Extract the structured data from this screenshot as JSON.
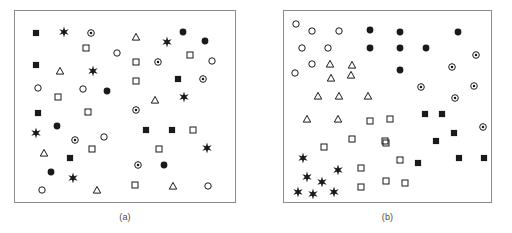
{
  "figure": {
    "width": 512,
    "height": 233,
    "background": "#ffffff",
    "frame_color": "#8c8c8c",
    "ink_color": "#1a1a1a"
  },
  "legend_symbols": {
    "filled-square": "filled square",
    "open-square": "open square",
    "filled-circle": "filled circle",
    "open-circle": "open circle",
    "circled-dot": "circle with center dot",
    "triangle": "open triangle",
    "star": "six-pointed star / asterisk"
  },
  "chart_data": {
    "type": "scatter",
    "title": "",
    "xlabel": "",
    "ylabel": "",
    "grid": false,
    "legend_position": "none",
    "panels": [
      {
        "id": "a",
        "caption": "(a)",
        "frame": {
          "x": 14,
          "y": 10,
          "width": 222,
          "height": 193
        },
        "xlim": [
          0,
          100
        ],
        "ylim": [
          0,
          100
        ],
        "description": "randomly intermixed symbol classes",
        "series": [
          {
            "name": "filled-square",
            "points": [
              [
                36,
                33
              ],
              [
                36,
                65
              ],
              [
                178,
                79
              ],
              [
                38,
                113
              ],
              [
                70,
                158
              ],
              [
                146,
                130
              ],
              [
                172,
                130
              ]
            ]
          },
          {
            "name": "open-square",
            "points": [
              [
                86,
                48
              ],
              [
                58,
                97
              ],
              [
                136,
                62
              ],
              [
                190,
                55
              ],
              [
                136,
                81
              ],
              [
                88,
                112
              ],
              [
                92,
                149
              ],
              [
                193,
                130
              ],
              [
                159,
                149
              ],
              [
                135,
                185
              ]
            ]
          },
          {
            "name": "filled-circle",
            "points": [
              [
                107,
                91
              ],
              [
                183,
                32
              ],
              [
                205,
                41
              ],
              [
                57,
                126
              ],
              [
                51,
                172
              ],
              [
                164,
                165
              ]
            ]
          },
          {
            "name": "open-circle",
            "points": [
              [
                117,
                53
              ],
              [
                38,
                88
              ],
              [
                83,
                89
              ],
              [
                212,
                61
              ],
              [
                104,
                137
              ],
              [
                42,
                190
              ],
              [
                208,
                186
              ]
            ]
          },
          {
            "name": "circled-dot",
            "points": [
              [
                91,
                33
              ],
              [
                158,
                62
              ],
              [
                203,
                79
              ],
              [
                75,
                140
              ],
              [
                136,
                110
              ],
              [
                138,
                165
              ]
            ]
          },
          {
            "name": "triangle",
            "points": [
              [
                60,
                71
              ],
              [
                136,
                37
              ],
              [
                155,
                100
              ],
              [
                44,
                153
              ],
              [
                97,
                190
              ],
              [
                173,
                186
              ]
            ]
          },
          {
            "name": "star",
            "points": [
              [
                64,
                32
              ],
              [
                93,
                71
              ],
              [
                167,
                42
              ],
              [
                184,
                97
              ],
              [
                36,
                133
              ],
              [
                73,
                178
              ],
              [
                207,
                148
              ]
            ]
          }
        ]
      },
      {
        "id": "b",
        "caption": "(b)",
        "frame": {
          "x": 283,
          "y": 10,
          "width": 209,
          "height": 193
        },
        "xlim": [
          0,
          100
        ],
        "ylim": [
          0,
          100
        ],
        "description": "symbol classes sorted into spatially coherent clusters",
        "series": [
          {
            "name": "open-circle",
            "points": [
              [
                296,
                24
              ],
              [
                312,
                31
              ],
              [
                339,
                31
              ],
              [
                302,
                48
              ],
              [
                328,
                48
              ],
              [
                312,
                64
              ],
              [
                295,
                73
              ]
            ]
          },
          {
            "name": "filled-circle",
            "points": [
              [
                370,
                30
              ],
              [
                400,
                32
              ],
              [
                458,
                32
              ],
              [
                370,
                48
              ],
              [
                400,
                48
              ],
              [
                426,
                48
              ],
              [
                400,
                70
              ]
            ]
          },
          {
            "name": "circled-dot",
            "points": [
              [
                476,
                55
              ],
              [
                452,
                67
              ],
              [
                421,
                87
              ],
              [
                474,
                86
              ],
              [
                455,
                98
              ],
              [
                483,
                127
              ]
            ]
          },
          {
            "name": "triangle",
            "points": [
              [
                352,
                65
              ],
              [
                330,
                64
              ],
              [
                351,
                75
              ],
              [
                331,
                78
              ],
              [
                318,
                96
              ],
              [
                339,
                96
              ],
              [
                368,
                96
              ],
              [
                307,
                119
              ],
              [
                338,
                119
              ]
            ]
          },
          {
            "name": "open-square",
            "points": [
              [
                370,
                121
              ],
              [
                390,
                119
              ],
              [
                352,
                139
              ],
              [
                385,
                141
              ],
              [
                324,
                147
              ],
              [
                386,
                143
              ],
              [
                361,
                168
              ],
              [
                400,
                160
              ],
              [
                361,
                187
              ],
              [
                386,
                181
              ],
              [
                405,
                183
              ]
            ]
          },
          {
            "name": "filled-square",
            "points": [
              [
                425,
                114
              ],
              [
                442,
                114
              ],
              [
                454,
                133
              ],
              [
                436,
                141
              ],
              [
                418,
                163
              ],
              [
                459,
                158
              ],
              [
                484,
                158
              ]
            ]
          },
          {
            "name": "star",
            "points": [
              [
                303,
                158
              ],
              [
                338,
                170
              ],
              [
                307,
                177
              ],
              [
                322,
                182
              ],
              [
                298,
                192
              ],
              [
                313,
                194
              ],
              [
                334,
                192
              ]
            ]
          }
        ]
      }
    ]
  }
}
